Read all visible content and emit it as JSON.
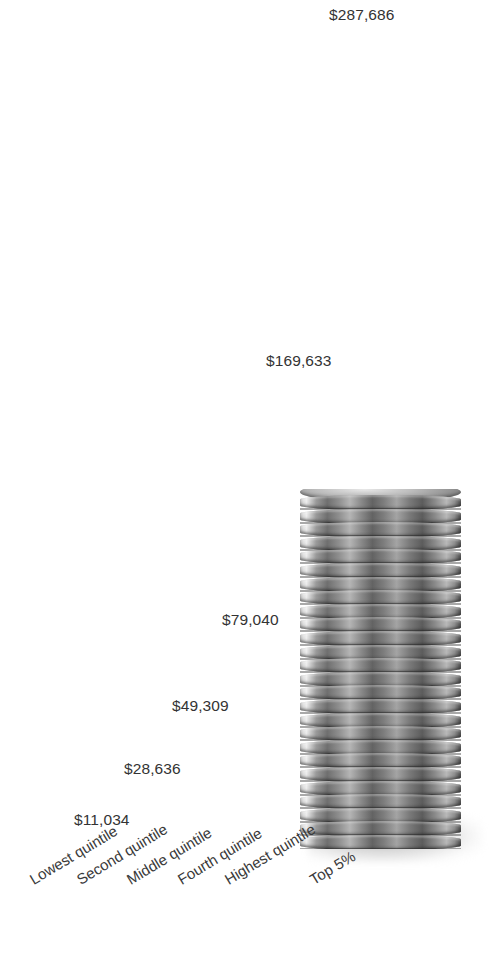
{
  "chart_data": {
    "type": "bar",
    "title": "",
    "subtitle": "",
    "xlabel": "",
    "ylabel": "",
    "categories": [
      "Lowest quintile",
      "Second quintile",
      "Middle quintile",
      "Fourth quintile",
      "Highest quintile",
      "Top 5%"
    ],
    "values": [
      11034,
      28636,
      49309,
      79040,
      169633,
      287686
    ],
    "value_labels": [
      "$11,034",
      "$28,636",
      "$49,309",
      "$79,040",
      "$169,633",
      "$287,686"
    ],
    "ylim": [
      0,
      287686
    ],
    "grid": false,
    "legend": null,
    "axis_ticks": [],
    "series": [
      {
        "name": "Mean household income",
        "values": [
          11034,
          28636,
          49309,
          79040,
          169633,
          287686
        ]
      }
    ],
    "annotations": [
      {
        "name": "coin-stack-photo",
        "description": "photograph of a tall stack of coins behind the two tallest bars"
      }
    ],
    "colors": {
      "bar": "#c9c9c9",
      "bar_emphasis": "#a6a6a6",
      "value_text": "#333333",
      "category_text": "#3a3a3a",
      "background": "#ffffff"
    }
  },
  "bars": [
    {
      "category": "Lowest quintile",
      "value_label": "$11,034",
      "value": 11034,
      "left": 90,
      "width": 38,
      "height": 31,
      "label_left": 74,
      "label_top": 812,
      "emphasis": false
    },
    {
      "category": "Second quintile",
      "value_label": "$28,636",
      "value": 28636,
      "left": 140,
      "width": 38,
      "height": 82,
      "label_left": 124,
      "label_top": 761,
      "emphasis": false
    },
    {
      "category": "Middle quintile",
      "value_label": "$49,309",
      "value": 49309,
      "left": 189,
      "width": 38,
      "height": 145,
      "label_left": 172,
      "label_top": 698,
      "emphasis": false
    },
    {
      "category": "Fourth quintile",
      "value_label": "$79,040",
      "value": 79040,
      "left": 238,
      "width": 38,
      "height": 231,
      "label_left": 222,
      "label_top": 612,
      "emphasis": false
    },
    {
      "category": "Highest quintile",
      "value_label": "$169,633",
      "value": 169633,
      "left": 288,
      "width": 38,
      "height": 490,
      "label_left": 266,
      "label_top": 353,
      "emphasis": false
    },
    {
      "category": "Top 5%",
      "value_label": "$287,686",
      "value": 287686,
      "left": 351,
      "width": 38,
      "height": 836,
      "label_left": 329,
      "label_top": 7,
      "emphasis": true
    }
  ],
  "category_labels": [
    {
      "text": "Lowest quintile",
      "left": 27,
      "top": 874
    },
    {
      "text": "Second quintile",
      "left": 74,
      "top": 874
    },
    {
      "text": "Middle quintile",
      "left": 124,
      "top": 874
    },
    {
      "text": "Fourth quintile",
      "left": 175,
      "top": 874
    },
    {
      "text": "Highest quintile",
      "left": 222,
      "top": 874
    },
    {
      "text": "Top 5%",
      "left": 307,
      "top": 874
    }
  ]
}
